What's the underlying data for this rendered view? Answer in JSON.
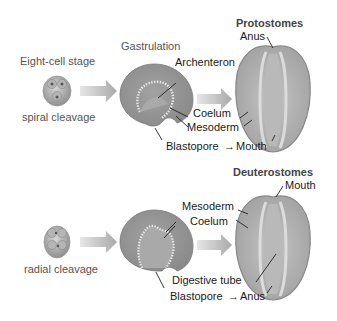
{
  "title_top": "Protostomes",
  "title_bottom": "Deuterostomes",
  "stage_label": "Eight-cell stage",
  "gastrulation_label": "Gastrulation",
  "protostome": {
    "cleavage": "spiral cleavage",
    "labels": {
      "archenteron": "Archenteron",
      "coelum": "Coelum",
      "mesoderm": "Mesoderm",
      "blastopore": "Blastopore",
      "arrow": "→",
      "mouth": "Mouth",
      "anus": "Anus"
    }
  },
  "deuterostome": {
    "cleavage": "radial cleavage",
    "labels": {
      "mesoderm": "Mesoderm",
      "coelum": "Coelum",
      "digestive_tube": "Digestive tube",
      "blastopore": "Blastopore",
      "arrow": "→",
      "anus": "Anus",
      "mouth": "Mouth"
    }
  },
  "colors": {
    "embryo_fill": "#a8a8a8",
    "embryo_dark": "#7d7d7d",
    "body_fill": "#b4b4b4",
    "body_inner": "#c8c8c8",
    "arrow_fill": "#bdbdbd",
    "text": "#1a1a1a",
    "label_grey": "#555555"
  }
}
